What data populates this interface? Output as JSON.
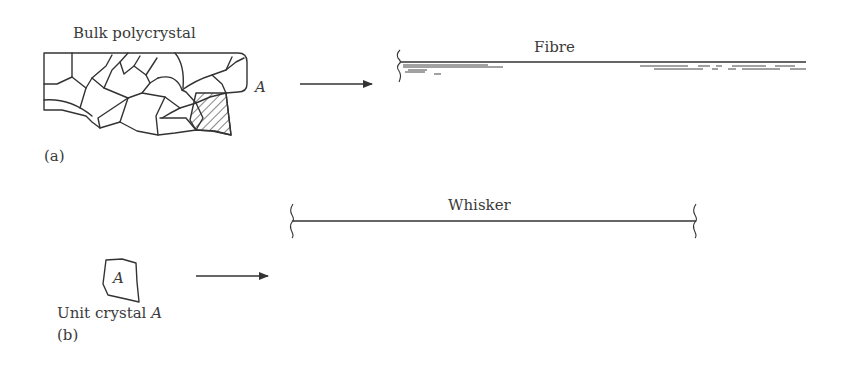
{
  "figure": {
    "panel_a": {
      "label": "(a)",
      "polycrystal_title": "Bulk polycrystal",
      "grain_label": "A",
      "product_title": "Fibre"
    },
    "panel_b": {
      "label": "(b)",
      "crystal_letter": "A",
      "crystal_caption_prefix": "Unit crystal ",
      "crystal_caption_letter": "A",
      "product_title": "Whisker"
    },
    "colors": {
      "ink": "#333333",
      "text": "#3a3a3a",
      "background": "#ffffff"
    }
  }
}
